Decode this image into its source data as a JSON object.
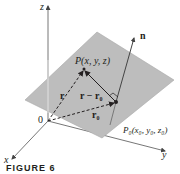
{
  "figure": {
    "caption": "FIGURE 6",
    "colors": {
      "plane_fill": "#bdbdbd",
      "plane_edge": "#9a9a9a",
      "axis": "#555555",
      "ink": "#231f20",
      "background": "#ffffff"
    },
    "axes": {
      "z_label": "z",
      "x_label": "x",
      "y_label": "y",
      "origin_label": "0"
    },
    "points": {
      "P_label": "P(x, y, z)",
      "P0_label": "P₀(x₀, y₀, z₀)"
    },
    "vectors": {
      "r_label": "r",
      "r_minus_r0_label": "r − r₀",
      "r0_label": "r₀",
      "n_label": "n"
    }
  }
}
